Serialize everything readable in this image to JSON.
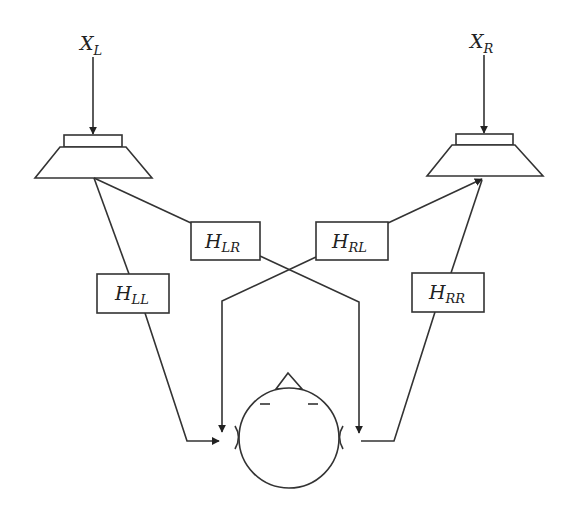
{
  "diagram": {
    "type": "binaural crosstalk / transfer path diagram",
    "colors": {
      "line": "#333333",
      "background": "#ffffff",
      "text": "#222222"
    },
    "inputs": [
      {
        "id": "left-input",
        "main": "X",
        "sub": "L"
      },
      {
        "id": "right-input",
        "main": "X",
        "sub": "R"
      }
    ],
    "speakers": [
      {
        "id": "left-speaker"
      },
      {
        "id": "right-speaker"
      }
    ],
    "transfer_functions": [
      {
        "id": "H_LL",
        "main": "H",
        "sub": "LL"
      },
      {
        "id": "H_LR",
        "main": "H",
        "sub": "LR"
      },
      {
        "id": "H_RL",
        "main": "H",
        "sub": "RL"
      },
      {
        "id": "H_RR",
        "main": "H",
        "sub": "RR"
      }
    ],
    "listener": {
      "id": "listener-head"
    }
  }
}
